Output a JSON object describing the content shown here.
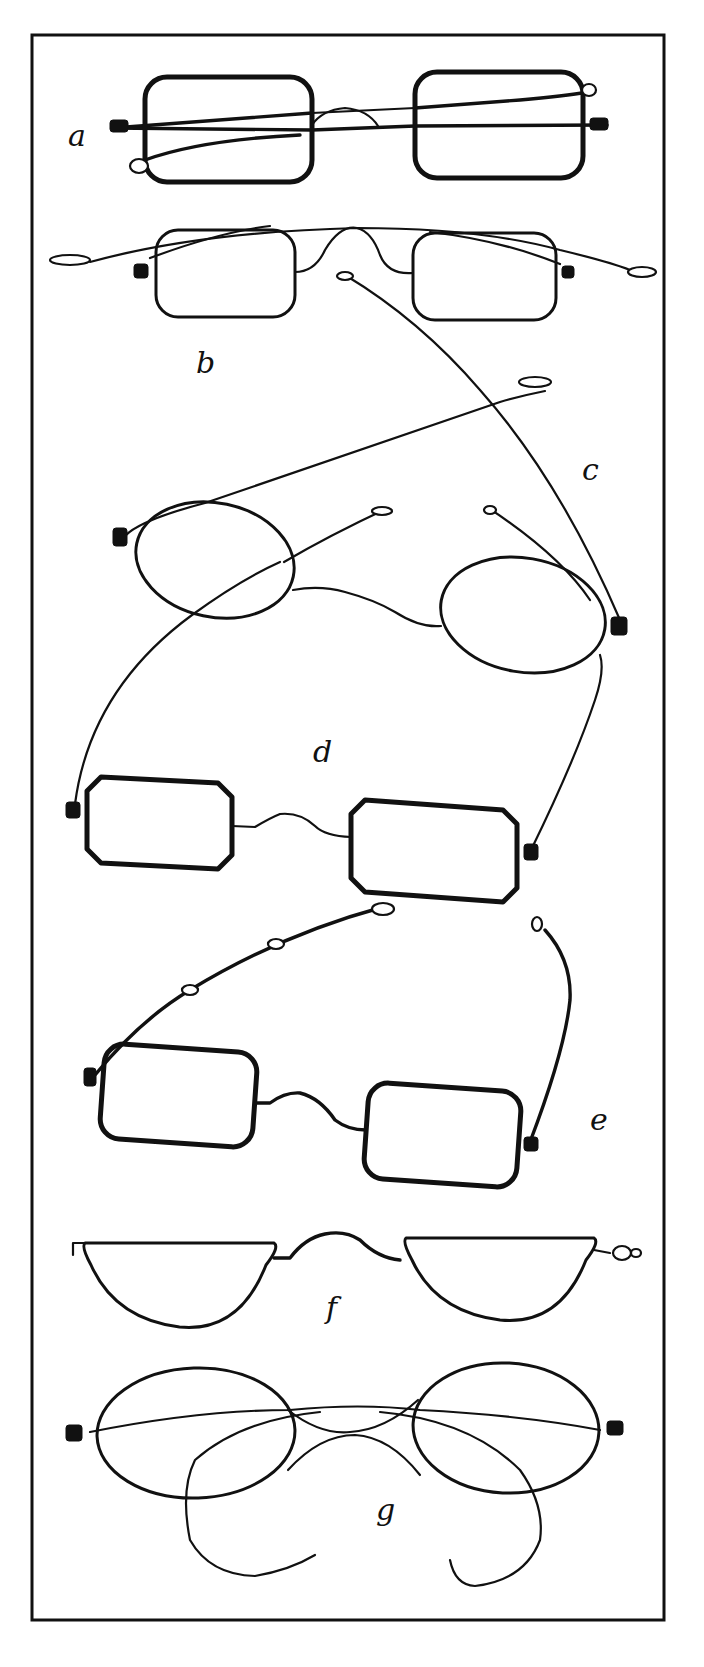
{
  "figure": {
    "colors": {
      "ink": "#111111",
      "paper": "#ffffff"
    },
    "frame": {
      "x": 32,
      "y": 35,
      "width": 632,
      "height": 1585
    },
    "labels": [
      {
        "id": "a",
        "text": "a",
        "x": 68,
        "y": 146
      },
      {
        "id": "b",
        "text": "b",
        "x": 196,
        "y": 373
      },
      {
        "id": "c",
        "text": "c",
        "x": 582,
        "y": 480
      },
      {
        "id": "d",
        "text": "d",
        "x": 313,
        "y": 762
      },
      {
        "id": "e",
        "text": "e",
        "x": 590,
        "y": 1130
      },
      {
        "id": "f",
        "text": "f",
        "x": 326,
        "y": 1318
      },
      {
        "id": "g",
        "text": "g",
        "x": 376,
        "y": 1520
      }
    ],
    "spectacles": [
      {
        "id": "a",
        "style": "square rims, folded sliding temples",
        "rims": [
          {
            "shape": "rect",
            "x": 145,
            "y": 77,
            "w": 167,
            "h": 105,
            "r": 22,
            "heavy": true
          },
          {
            "shape": "rect",
            "x": 415,
            "y": 72,
            "w": 168,
            "h": 106,
            "r": 22,
            "heavy": true
          }
        ],
        "wires": [
          {
            "d": "M 113 128 L 312 113",
            "heavy": true
          },
          {
            "d": "M 312 113 L 415 108",
            "heavy": false
          },
          {
            "d": "M 415 108 L 520 100 Q 565 96 588 92",
            "heavy": true
          },
          {
            "d": "M 113 128 L 312 130 L 415 126 L 607 125",
            "heavy": true
          },
          {
            "d": "M 145 160 Q 200 140 300 135",
            "heavy": true
          },
          {
            "d": "M 312 125 Q 322 110 345 108 Q 368 110 378 126",
            "heavy": false
          }
        ],
        "hinges": [
          {
            "x": 110,
            "y": 120,
            "w": 18,
            "h": 12
          },
          {
            "x": 590,
            "y": 118,
            "w": 18,
            "h": 12
          }
        ],
        "loops": [
          {
            "cx": 139,
            "cy": 166,
            "rx": 9,
            "ry": 7
          },
          {
            "cx": 589,
            "cy": 90,
            "rx": 7,
            "ry": 6
          }
        ]
      },
      {
        "id": "b",
        "style": "square rims, high arched bridge, flat temples",
        "rims": [
          {
            "shape": "rect",
            "x": 156,
            "y": 230,
            "w": 139,
            "h": 87,
            "r": 22,
            "heavy": false
          },
          {
            "shape": "rect",
            "x": 413,
            "y": 233,
            "w": 143,
            "h": 87,
            "r": 22,
            "heavy": false
          }
        ],
        "wires": [
          {
            "d": "M 295 272 Q 315 272 325 250 Q 340 225 357 228 Q 372 232 380 255 Q 388 275 413 273",
            "heavy": false
          },
          {
            "d": "M 90 262 Q 200 232 357 228 Q 480 228 560 250 Q 610 262 630 270",
            "heavy": false
          },
          {
            "d": "M 150 258 Q 220 232 270 226",
            "heavy": false
          },
          {
            "d": "M 430 232 Q 500 240 560 264",
            "heavy": false
          }
        ],
        "hinges": [
          {
            "x": 134,
            "y": 264,
            "w": 14,
            "h": 14
          },
          {
            "x": 562,
            "y": 266,
            "w": 12,
            "h": 12
          }
        ],
        "loops": [
          {
            "cx": 70,
            "cy": 260,
            "rx": 20,
            "ry": 5
          },
          {
            "cx": 642,
            "cy": 272,
            "rx": 14,
            "ry": 5
          }
        ]
      },
      {
        "id": "c",
        "style": "oval rims, straight long temples",
        "rims": [
          {
            "shape": "ellipse",
            "cx": 215,
            "cy": 560,
            "rx": 80,
            "ry": 57,
            "rot": 12
          },
          {
            "shape": "ellipse",
            "cx": 523,
            "cy": 615,
            "rx": 83,
            "ry": 57,
            "rot": 10
          }
        ],
        "wires": [
          {
            "d": "M 293 590 Q 320 585 345 592 Q 375 600 395 612 Q 420 628 441 626",
            "heavy": false
          },
          {
            "d": "M 125 536 Q 140 520 205 503 Q 360 450 500 402 Q 520 396 545 391",
            "heavy": false
          },
          {
            "d": "M 620 620 Q 560 480 480 390 Q 420 320 345 275",
            "heavy": false
          },
          {
            "d": "M 487 507 Q 560 555 590 600",
            "heavy": false
          },
          {
            "d": "M 284 562 Q 330 535 388 508",
            "heavy": false
          }
        ],
        "hinges": [
          {
            "x": 113,
            "y": 528,
            "w": 14,
            "h": 18
          },
          {
            "x": 611,
            "y": 617,
            "w": 16,
            "h": 18
          }
        ],
        "loops": [
          {
            "cx": 535,
            "cy": 382,
            "rx": 16,
            "ry": 5
          },
          {
            "cx": 345,
            "cy": 276,
            "rx": 8,
            "ry": 4
          },
          {
            "cx": 382,
            "cy": 511,
            "rx": 10,
            "ry": 4
          },
          {
            "cx": 490,
            "cy": 510,
            "rx": 6,
            "ry": 4
          }
        ]
      },
      {
        "id": "d",
        "style": "octagonal rims, curved wire temples",
        "rims": [
          {
            "shape": "octagon",
            "x": 87,
            "y": 777,
            "w": 145,
            "h": 86,
            "c": 14,
            "skew": 6
          },
          {
            "shape": "octagon",
            "x": 351,
            "y": 800,
            "w": 166,
            "h": 92,
            "c": 14,
            "skew": 10
          }
        ],
        "wires": [
          {
            "d": "M 232 826 L 255 827 Q 270 818 280 814 Q 300 812 315 826 Q 325 836 351 837",
            "heavy": false
          },
          {
            "d": "M 75 804 Q 90 690 192 615 Q 240 580 280 562",
            "heavy": false
          },
          {
            "d": "M 531 850 Q 575 760 595 700 Q 605 670 600 655",
            "heavy": false
          }
        ],
        "hinges": [
          {
            "x": 66,
            "y": 802,
            "w": 14,
            "h": 16
          },
          {
            "x": 524,
            "y": 844,
            "w": 14,
            "h": 16
          }
        ],
        "loops": []
      },
      {
        "id": "e",
        "style": "rounded rectangular rims, jointed sliding temples",
        "rims": [
          {
            "shape": "rect",
            "x": 102,
            "y": 1048,
            "w": 153,
            "h": 95,
            "r": 20,
            "heavy": true,
            "rot": 4
          },
          {
            "shape": "rect",
            "x": 366,
            "y": 1087,
            "w": 153,
            "h": 96,
            "r": 20,
            "heavy": true,
            "rot": 4
          }
        ],
        "wires": [
          {
            "d": "M 255 1103 L 270 1103 Q 285 1092 300 1093 Q 320 1098 335 1120 Q 348 1130 366 1130",
            "heavy": true
          },
          {
            "d": "M 95 1075 Q 140 1020 190 990 Q 280 935 383 907",
            "heavy": true
          },
          {
            "d": "M 530 1142 Q 565 1050 570 1000 Q 572 960 545 930",
            "heavy": true
          }
        ],
        "hinges": [
          {
            "x": 84,
            "y": 1068,
            "w": 12,
            "h": 18
          },
          {
            "x": 524,
            "y": 1137,
            "w": 14,
            "h": 14
          }
        ],
        "loops": [
          {
            "cx": 383,
            "cy": 909,
            "rx": 11,
            "ry": 6
          },
          {
            "cx": 537,
            "cy": 924,
            "rx": 5,
            "ry": 7
          },
          {
            "cx": 190,
            "cy": 990,
            "rx": 8,
            "ry": 5
          },
          {
            "cx": 276,
            "cy": 944,
            "rx": 8,
            "ry": 5
          }
        ]
      },
      {
        "id": "f",
        "style": "half-moon reading rims",
        "rims": [
          {
            "shape": "halfmoon",
            "x1": 85,
            "x2": 274,
            "top": 1243,
            "bottom": 1327
          },
          {
            "shape": "halfmoon",
            "x1": 406,
            "x2": 594,
            "top": 1238,
            "bottom": 1320
          }
        ],
        "wires": [
          {
            "d": "M 274 1258 L 290 1258 Q 305 1238 325 1234 Q 345 1230 360 1240 Q 378 1258 400 1260",
            "heavy": true
          },
          {
            "d": "M 85 1243 L 73 1243 L 73 1255",
            "heavy": false
          },
          {
            "d": "M 594 1250 L 610 1253",
            "heavy": false
          }
        ],
        "hinges": [],
        "loops": [
          {
            "cx": 622,
            "cy": 1253,
            "rx": 9,
            "ry": 7
          },
          {
            "cx": 636,
            "cy": 1253,
            "rx": 5,
            "ry": 4
          }
        ]
      },
      {
        "id": "g",
        "style": "large oval rims, X-bridge, curl temples",
        "rims": [
          {
            "shape": "ellipse",
            "cx": 196,
            "cy": 1433,
            "rx": 99,
            "ry": 65,
            "rot": -2
          },
          {
            "shape": "ellipse",
            "cx": 506,
            "cy": 1428,
            "rx": 93,
            "ry": 65,
            "rot": 3
          }
        ],
        "wires": [
          {
            "d": "M 90 1432 Q 200 1410 290 1410 Q 360 1403 420 1410 Q 520 1415 600 1430",
            "heavy": false
          },
          {
            "d": "M 288 1410 Q 320 1435 350 1432 Q 385 1430 418 1400",
            "heavy": false
          },
          {
            "d": "M 288 1470 Q 320 1435 355 1435 Q 390 1437 420 1475",
            "heavy": false
          },
          {
            "d": "M 320 1412 Q 240 1420 195 1460 Q 180 1490 190 1540 Q 210 1575 255 1576 Q 290 1570 315 1555",
            "heavy": false
          },
          {
            "d": "M 380 1412 Q 470 1420 520 1470 Q 545 1505 540 1540 Q 525 1580 475 1586 Q 455 1585 450 1560",
            "heavy": false
          }
        ],
        "hinges": [
          {
            "x": 66,
            "y": 1425,
            "w": 16,
            "h": 16
          },
          {
            "x": 607,
            "y": 1421,
            "w": 16,
            "h": 14
          }
        ],
        "loops": []
      }
    ]
  }
}
